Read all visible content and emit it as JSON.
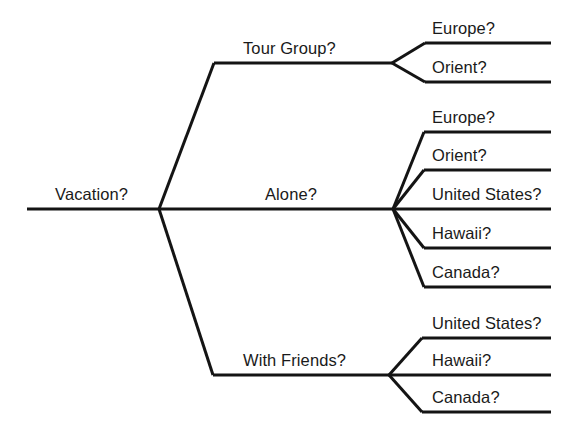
{
  "diagram": {
    "type": "decision-tree",
    "title_node": "Vacation?",
    "line_color": "#141414",
    "background_color": "#ffffff",
    "text_color": "#1a1a1a",
    "root": {
      "label": "Vacation?",
      "label_x": 55,
      "label_y": 186,
      "stem_start_x": 27,
      "stem_end_x": 159,
      "stem_y": 209
    },
    "branches": [
      {
        "id": "tour-group",
        "label": "Tour Group?",
        "label_x": 243,
        "label_y": 40,
        "junction_x": 392,
        "junction_y": 63,
        "stem_start_x": 214,
        "stem_y": 63,
        "children": [
          {
            "id": "tour-group-europe",
            "label": "Europe?",
            "label_x": 432,
            "label_y": 20,
            "line_y": 43,
            "line_start_x": 425,
            "line_end_x": 551
          },
          {
            "id": "tour-group-orient",
            "label": "Orient?",
            "label_x": 432,
            "label_y": 59,
            "line_y": 82,
            "line_start_x": 425,
            "line_end_x": 551
          }
        ]
      },
      {
        "id": "alone",
        "label": "Alone?",
        "label_x": 265,
        "label_y": 186,
        "junction_x": 393,
        "junction_y": 209,
        "stem_start_x": 159,
        "stem_y": 209,
        "children": [
          {
            "id": "alone-europe",
            "label": "Europe?",
            "label_x": 432,
            "label_y": 109,
            "line_y": 132,
            "line_start_x": 424,
            "line_end_x": 551
          },
          {
            "id": "alone-orient",
            "label": "Orient?",
            "label_x": 432,
            "label_y": 147,
            "line_y": 170,
            "line_start_x": 424,
            "line_end_x": 551
          },
          {
            "id": "alone-united-states",
            "label": "United States?",
            "label_x": 432,
            "label_y": 186,
            "line_y": 209,
            "line_start_x": 393,
            "line_end_x": 551
          },
          {
            "id": "alone-hawaii",
            "label": "Hawaii?",
            "label_x": 432,
            "label_y": 225,
            "line_y": 248,
            "line_start_x": 424,
            "line_end_x": 551
          },
          {
            "id": "alone-canada",
            "label": "Canada?",
            "label_x": 432,
            "label_y": 264,
            "line_y": 287,
            "line_start_x": 424,
            "line_end_x": 551
          }
        ]
      },
      {
        "id": "with-friends",
        "label": "With Friends?",
        "label_x": 243,
        "label_y": 352,
        "junction_x": 389,
        "junction_y": 375,
        "stem_start_x": 213,
        "stem_y": 375,
        "children": [
          {
            "id": "with-friends-united-states",
            "label": "United States?",
            "label_x": 432,
            "label_y": 315,
            "line_y": 338,
            "line_start_x": 422,
            "line_end_x": 551
          },
          {
            "id": "with-friends-hawaii",
            "label": "Hawaii?",
            "label_x": 432,
            "label_y": 352,
            "line_y": 375,
            "line_start_x": 389,
            "line_end_x": 551
          },
          {
            "id": "with-friends-canada",
            "label": "Canada?",
            "label_x": 432,
            "label_y": 389,
            "line_y": 412,
            "line_start_x": 422,
            "line_end_x": 551
          }
        ]
      }
    ]
  }
}
